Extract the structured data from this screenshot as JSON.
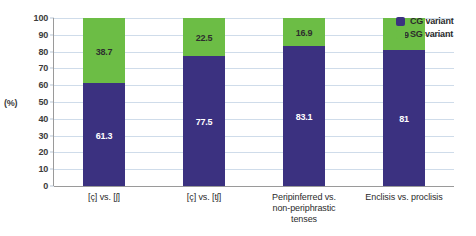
{
  "axis_unit_label": "(%)",
  "legend": {
    "items": [
      {
        "label": "CG variant",
        "color": "#3b3180",
        "key": "cg"
      },
      {
        "label": "SG variant",
        "color": "#6cbd45",
        "key": "sg"
      }
    ]
  },
  "chart_data": {
    "type": "bar",
    "subtype": "stacked-100",
    "title": "",
    "xlabel": "",
    "ylabel": "(%)",
    "ylim": [
      0,
      100
    ],
    "ytick_step": 10,
    "yticks": [
      0,
      10,
      20,
      30,
      40,
      50,
      60,
      70,
      80,
      90,
      100
    ],
    "ytick_labels": [
      "0",
      "10",
      "20",
      "30",
      "40",
      "50",
      "60",
      "70",
      "80",
      "90",
      "100"
    ],
    "grid": true,
    "grid_axis": "y",
    "legend_position": "top-right",
    "categories": [
      "[ç] vs. [ʃ]",
      "[ç] vs. [tʃ]",
      "Peripinferred vs. non-periphrastic tenses",
      "Enclisis vs. proclisis"
    ],
    "category_lines": [
      [
        "[ç] vs. [ʃ]"
      ],
      [
        "[ç] vs. [tʃ]"
      ],
      [
        "Peripinferred vs.",
        "non-periphrastic",
        "tenses"
      ],
      [
        "Enclisis vs. proclisis"
      ]
    ],
    "series": [
      {
        "name": "CG variant",
        "color": "#3b3180",
        "values": [
          61.3,
          77.5,
          83.1,
          81
        ],
        "labels": [
          "61.3",
          "77.5",
          "83.1",
          "81"
        ]
      },
      {
        "name": "SG variant",
        "color": "#6cbd45",
        "values": [
          38.7,
          22.5,
          16.9,
          19
        ],
        "labels": [
          "38.7",
          "22.5",
          "16.9",
          "19"
        ]
      }
    ]
  }
}
